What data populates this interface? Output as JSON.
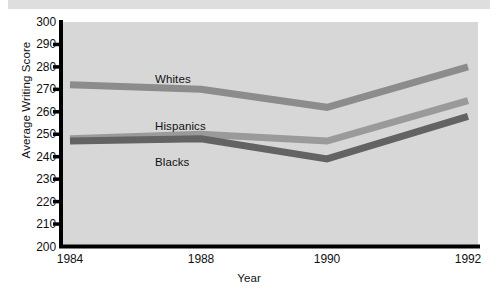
{
  "caption": {
    "text": ""
  },
  "chart_data": {
    "type": "line",
    "title": "",
    "xlabel": "Year",
    "ylabel": "Average Writing Score",
    "categories": [
      "1984",
      "1988",
      "1990",
      "1992"
    ],
    "x": [
      1984,
      1988,
      1990,
      1992
    ],
    "xtick_positions_px": [
      70,
      201,
      327,
      468
    ],
    "xlim": [
      1984,
      1992
    ],
    "ylim": [
      200,
      300
    ],
    "yticks": [
      300,
      290,
      280,
      270,
      260,
      250,
      240,
      230,
      220,
      210,
      200
    ],
    "grid": false,
    "legend_position": "inline-labels",
    "series": [
      {
        "name": "Whites",
        "values": [
          272,
          270,
          262,
          280
        ],
        "color": "#8c8c8c",
        "label_x_px": 155,
        "label_y_px": 73
      },
      {
        "name": "Hispanics",
        "values": [
          248,
          250,
          247,
          265
        ],
        "color": "#9a9a9a",
        "label_x_px": 155,
        "label_y_px": 120
      },
      {
        "name": "Blacks",
        "values": [
          247,
          248,
          239,
          258
        ],
        "color": "#636363",
        "label_x_px": 155,
        "label_y_px": 156
      }
    ],
    "colors": {
      "plot_background": "#d7d7d7",
      "figure_background": "#ffffff",
      "axis": "#000000",
      "text": "#111111"
    }
  }
}
